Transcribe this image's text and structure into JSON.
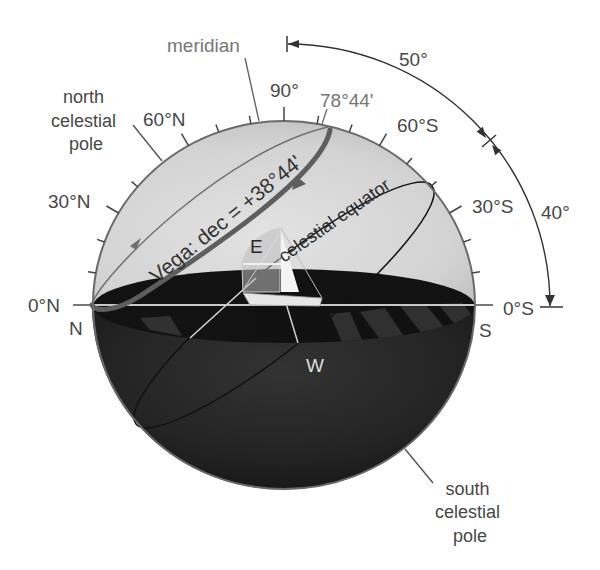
{
  "figure": {
    "labels": {
      "meridian": "meridian",
      "north_celestial_pole": [
        "north",
        "celestial",
        "pole"
      ],
      "south_celestial_pole": [
        "south",
        "celestial",
        "pole"
      ],
      "vega_circle": "Vega: dec = +38°44'",
      "celestial_equator": "celestial equator",
      "vega_max_altitude": "78°44'",
      "arc_zenith_to_equator": "50°",
      "arc_equator_to_horizon": "40°"
    },
    "altitude_scale": {
      "north_0": "0°N",
      "north_30": "30°N",
      "north_60": "60°N",
      "zenith_90": "90°",
      "south_60": "60°S",
      "south_30": "30°S",
      "south_0": "0°S",
      "tick_angles_deg": [
        10,
        20,
        30,
        40,
        60,
        70,
        80,
        90,
        100,
        110,
        120,
        130,
        140,
        150,
        160,
        170
      ],
      "major_tick_angles_deg": [
        30,
        60,
        90,
        120,
        150
      ]
    },
    "cardinal_points": {
      "north": "N",
      "south": "S",
      "east": "E",
      "west": "W"
    },
    "colors": {
      "sky_hemisphere": "#d6d6d6",
      "below_horizon": "#1f1f1f",
      "vega_path": "#5e5e5e",
      "celestial_equator": "#111111",
      "label_text": "#484848"
    }
  }
}
